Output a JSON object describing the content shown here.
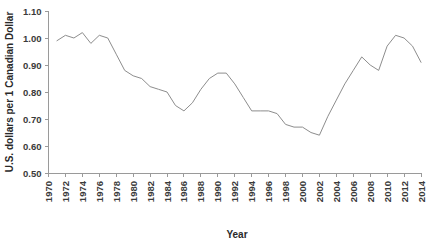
{
  "chart_data": {
    "type": "line",
    "title": "",
    "xlabel": "Year",
    "ylabel": "U.S. dollars per 1 Canadian Dollar",
    "xlim": [
      1970,
      2014
    ],
    "ylim": [
      0.5,
      1.1
    ],
    "grid": false,
    "legend": "none",
    "y_ticks": [
      "0.50",
      "0.60",
      "0.70",
      "0.80",
      "0.90",
      "1.00",
      "1.10"
    ],
    "y_tick_values": [
      0.5,
      0.6,
      0.7,
      0.8,
      0.9,
      1.0,
      1.1
    ],
    "x_ticks": [
      "1970",
      "1972",
      "1974",
      "1976",
      "1978",
      "1980",
      "1982",
      "1984",
      "1986",
      "1988",
      "1990",
      "1992",
      "1994",
      "1996",
      "1998",
      "2000",
      "2002",
      "2004",
      "2006",
      "2008",
      "2010",
      "2012",
      "2014"
    ],
    "x_tick_values": [
      1970,
      1972,
      1974,
      1976,
      1978,
      1980,
      1982,
      1984,
      1986,
      1988,
      1990,
      1992,
      1994,
      1996,
      1998,
      2000,
      2002,
      2004,
      2006,
      2008,
      2010,
      2012,
      2014
    ],
    "series": [
      {
        "name": "U.S. dollars per 1 Canadian Dollar",
        "color": "#8d8d8d",
        "x": [
          1971,
          1972,
          1973,
          1974,
          1975,
          1976,
          1977,
          1978,
          1979,
          1980,
          1981,
          1982,
          1983,
          1984,
          1985,
          1986,
          1987,
          1988,
          1989,
          1990,
          1991,
          1992,
          1993,
          1994,
          1995,
          1996,
          1997,
          1998,
          1999,
          2000,
          2001,
          2002,
          2003,
          2004,
          2005,
          2006,
          2007,
          2008,
          2009,
          2010,
          2011,
          2012,
          2013,
          2014
        ],
        "values": [
          0.99,
          1.01,
          1.0,
          1.02,
          0.98,
          1.01,
          1.0,
          0.94,
          0.88,
          0.86,
          0.85,
          0.82,
          0.81,
          0.8,
          0.75,
          0.73,
          0.76,
          0.81,
          0.85,
          0.87,
          0.87,
          0.83,
          0.78,
          0.73,
          0.73,
          0.73,
          0.72,
          0.68,
          0.67,
          0.67,
          0.65,
          0.64,
          0.71,
          0.77,
          0.83,
          0.88,
          0.93,
          0.9,
          0.88,
          0.97,
          1.01,
          1.0,
          0.97,
          0.91
        ]
      }
    ]
  },
  "axes": {
    "y_title": "U.S. dollars per 1 Canadian Dollar",
    "x_title": "Year"
  }
}
